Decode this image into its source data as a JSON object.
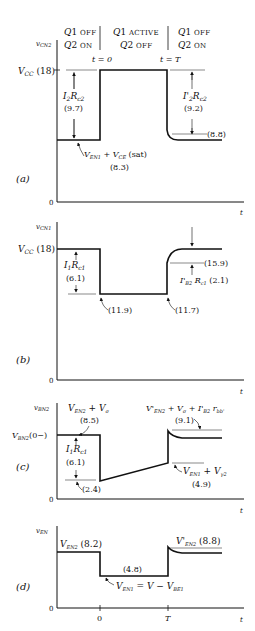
{
  "header": {
    "col1": {
      "line1": "Q1 OFF",
      "line2": "Q2 ON"
    },
    "col2": {
      "line1": "Q1 ACTIVE",
      "line2": "Q2 OFF"
    },
    "col3": {
      "line1": "Q1 OFF",
      "line2": "Q2 ON"
    },
    "t0": "t = 0",
    "tT": "t = T"
  },
  "panels": {
    "a": {
      "tag": "(a)",
      "ylabel": "vCN2",
      "vcc": "VCC (18)",
      "zero": "0",
      "xlabel": "t",
      "left_drop": "I2Rc2",
      "left_drop_val": "(9.7)",
      "low_label": "VEN1 + VCE (sat)",
      "low_val": "(8.3)",
      "right_drop": "I'2Rc2",
      "right_drop_val": "(9.2)",
      "right_level": "(8.8)"
    },
    "b": {
      "tag": "(b)",
      "ylabel": "vCN1",
      "vcc": "VCC (18)",
      "zero": "0",
      "xlabel": "t",
      "drop": "I1Rc1",
      "drop_val": "(6.1)",
      "low1": "(11.9)",
      "low2": "(11.7)",
      "overshoot": "(15.9)",
      "rise": "I'B2Rc1 (2.1)"
    },
    "c": {
      "tag": "(c)",
      "ylabel": "vBN2",
      "start": "VBN2(0−)",
      "zero": "0",
      "xlabel": "t",
      "top_left": "VEN2 + Vσ",
      "top_left_val": "(8.5)",
      "drop": "I1Rc1",
      "drop_val": "(6.1)",
      "low_val": "(2.4)",
      "top_right": "V'EN2 + Vσ + I'B2 rbb'",
      "top_right_val": "(9.1)",
      "ramp_end": "VEN1 + Vγ2",
      "ramp_end_val": "(4.9)"
    },
    "d": {
      "tag": "(d)",
      "ylabel": "vEN",
      "zero": "0",
      "xlabel": "t",
      "x0": "0",
      "xT": "T",
      "left": "VEN2 (8.2)",
      "mid_val": "(4.8)",
      "mid": "VEN1 = V − VBE1",
      "right": "V'EN2 (8.8)"
    }
  }
}
